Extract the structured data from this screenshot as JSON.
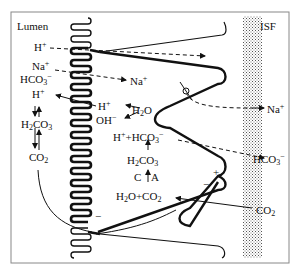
{
  "figure": {
    "regions": {
      "lumen": "Lumen",
      "isf": "ISF"
    },
    "lumen_labels": {
      "h_plus_top": "H",
      "na_plus": "Na",
      "hco3": "HCO",
      "h_plus": "H",
      "h2co3": "H",
      "co2": "CO"
    },
    "cell_labels": {
      "h_plus": "H",
      "oh_minus": "OH",
      "h2o": "H",
      "h_plus_hco3": "H",
      "h2co3": "H",
      "enzyme_c": "C",
      "enzyme_a": "A",
      "h2o_co2": "H"
    },
    "isf_labels": {
      "na_plus": "Na",
      "hco3_minus": "HCO",
      "co2": "CO"
    },
    "charges": {
      "minus_bottom": "−",
      "plus_right": "+",
      "minus_right": "−"
    },
    "colors": {
      "line": "#111111",
      "stipple": "#9a9a9a",
      "border": "#888888",
      "background": "#ffffff"
    }
  }
}
